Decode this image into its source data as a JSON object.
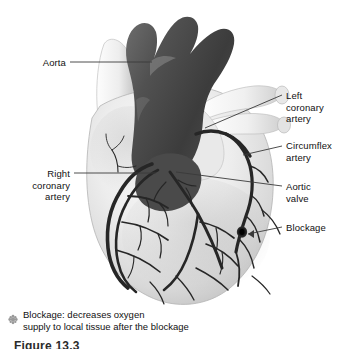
{
  "figure": {
    "background_color": "#ffffff",
    "caption_partial": "Figure 13.3"
  },
  "colors": {
    "background": "#ffffff",
    "aorta_dark": "#4a4a4a",
    "artery_dark": "#2e2e2e",
    "heart_light": "#e4e4e4",
    "heart_mid": "#cfcfcf",
    "vessel_white": "#f3f3f3",
    "leader_line": "#3a3a3a",
    "text": "#111111",
    "legend_marker": "#9a9a9a"
  },
  "labels": [
    {
      "id": "aorta",
      "text": "Aorta",
      "align": "right",
      "x": 18,
      "y": 57,
      "width": 48
    },
    {
      "id": "right-coronary-artery",
      "text": "Right\ncoronary\nartery",
      "align": "right",
      "x": 12,
      "y": 168,
      "width": 58
    },
    {
      "id": "left-coronary-artery",
      "text": "Left\ncoronary\nartery",
      "align": "left",
      "x": 286,
      "y": 90,
      "width": 60
    },
    {
      "id": "circumflex-artery",
      "text": "Circumflex\nartery",
      "align": "left",
      "x": 286,
      "y": 140,
      "width": 60
    },
    {
      "id": "aortic-valve",
      "text": "Aortic\nvalve",
      "align": "left",
      "x": 286,
      "y": 181,
      "width": 60
    },
    {
      "id": "blockage",
      "text": "Blockage",
      "align": "left",
      "x": 286,
      "y": 222,
      "width": 60
    }
  ],
  "legend": {
    "marker_name": "blockage-marker",
    "text": "Blockage: decreases oxygen\nsupply to local tissue after the blockage"
  },
  "structures": [
    "aortic-arch",
    "brachiocephalic-branches",
    "superior-vena-cava",
    "pulmonary-trunk",
    "pulmonary-artery-branches",
    "right-atrium",
    "left-ventricle",
    "right-ventricle",
    "right-coronary-artery",
    "left-coronary-artery",
    "circumflex-artery",
    "anterior-interventricular-artery",
    "blockage-node"
  ]
}
